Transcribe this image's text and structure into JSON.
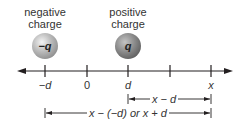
{
  "diagram": {
    "charges": [
      {
        "label_line1": "negative",
        "label_line2": "charge",
        "symbol": "−q",
        "position": "-d",
        "fill": "#b8b8b8"
      },
      {
        "label_line1": "positive",
        "label_line2": "charge",
        "symbol": "q",
        "position": "d",
        "fill": "#8a8a8a"
      }
    ],
    "axis": {
      "ticks": [
        {
          "label": "−d"
        },
        {
          "label": "0"
        },
        {
          "label": "d"
        },
        {
          "label": ""
        },
        {
          "label": "x"
        }
      ],
      "arrows": "both"
    },
    "dimensions": [
      {
        "label": "x − d",
        "from": "d",
        "to": "x"
      },
      {
        "label": "x − (−d) or x + d",
        "from": "-d",
        "to": "x"
      }
    ],
    "colors": {
      "line": "#231f20",
      "sphere_light": "#c8c8c8",
      "sphere_dark": "#7d7d7d"
    }
  }
}
